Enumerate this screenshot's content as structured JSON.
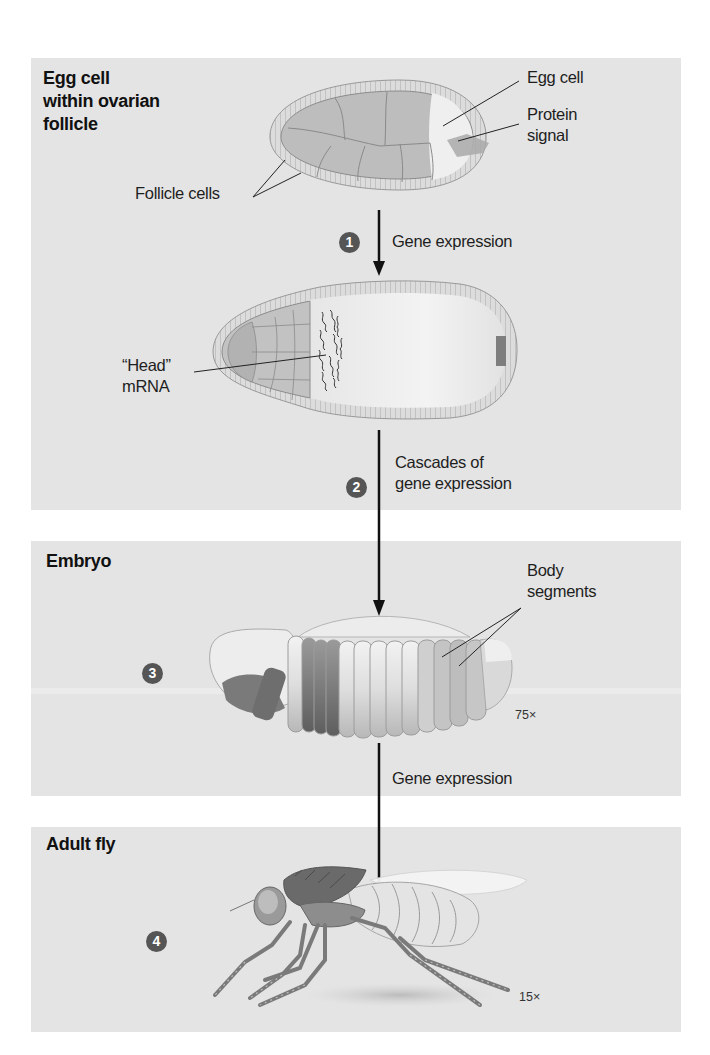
{
  "diagram": {
    "stages": [
      {
        "id": "egg-in-follicle",
        "title_lines": [
          "Egg cell",
          "within ovarian",
          "follicle"
        ],
        "labels": {
          "egg_cell": "Egg cell",
          "protein_signal_lines": [
            "Protein",
            "signal"
          ],
          "follicle_cells": "Follicle cells"
        }
      },
      {
        "id": "early-egg",
        "labels": {
          "head_mrna_lines": [
            "“Head”",
            "mRNA"
          ]
        }
      },
      {
        "id": "embryo",
        "title": "Embryo",
        "badge": "3",
        "labels": {
          "body_segments_lines": [
            "Body",
            "segments"
          ]
        },
        "magnification": "75×"
      },
      {
        "id": "adult-fly",
        "title": "Adult fly",
        "badge": "4",
        "magnification": "15×"
      }
    ],
    "steps": [
      {
        "badge": "1",
        "label_lines": [
          "Gene expression"
        ]
      },
      {
        "badge": "2",
        "label_lines": [
          "Cascades of",
          "gene expression"
        ]
      },
      {
        "badge": "",
        "label_lines": [
          "Gene expression"
        ]
      }
    ],
    "colors": {
      "panel_bg": "#e4e4e4",
      "badge_bg": "#555555",
      "arrow": "#111111",
      "cell_fill": "#bdbdbd",
      "follicle_ring": "#d6d6d6",
      "dark_segment": "#7a7a7a"
    }
  }
}
